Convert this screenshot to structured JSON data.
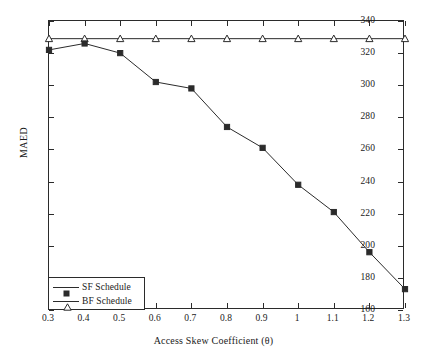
{
  "chart_data": {
    "type": "line",
    "title": "",
    "xlabel": "Access Skew Coefficient (θ)",
    "ylabel": "MAED",
    "x": [
      0.3,
      0.4,
      0.5,
      0.6,
      0.7,
      0.8,
      0.9,
      1.0,
      1.1,
      1.2,
      1.3
    ],
    "xtick_labels": [
      "0.3",
      "0.4",
      "0.5",
      "0.6",
      "0.7",
      "0.8",
      "0.9",
      "1",
      "1.1",
      "1.2",
      "1.3"
    ],
    "ytick_labels": [
      "340",
      "320",
      "300",
      "280",
      "260",
      "240",
      "220",
      "200",
      "180",
      "160"
    ],
    "ytick_values": [
      340,
      320,
      300,
      280,
      260,
      240,
      220,
      200,
      180,
      160
    ],
    "xlim": [
      0.3,
      1.3
    ],
    "ylim": [
      160,
      340
    ],
    "grid": false,
    "legend_position": "lower-left-inside",
    "series": [
      {
        "name": "SF Schedule",
        "marker": "filled-square",
        "color": "#2b2b2b",
        "values": [
          322,
          326,
          320,
          302,
          298,
          274,
          261,
          238,
          221,
          196,
          173
        ]
      },
      {
        "name": "BF Schedule",
        "marker": "open-triangle",
        "color": "#2b2b2b",
        "values": [
          329,
          329,
          329,
          329,
          329,
          329,
          329,
          329,
          329,
          329,
          329
        ]
      }
    ]
  },
  "legend": {
    "items": [
      {
        "label": "SF Schedule"
      },
      {
        "label": "BF Schedule"
      }
    ]
  },
  "axes": {
    "x_title": "Access Skew Coefficient (θ)",
    "y_title": "MAED"
  }
}
